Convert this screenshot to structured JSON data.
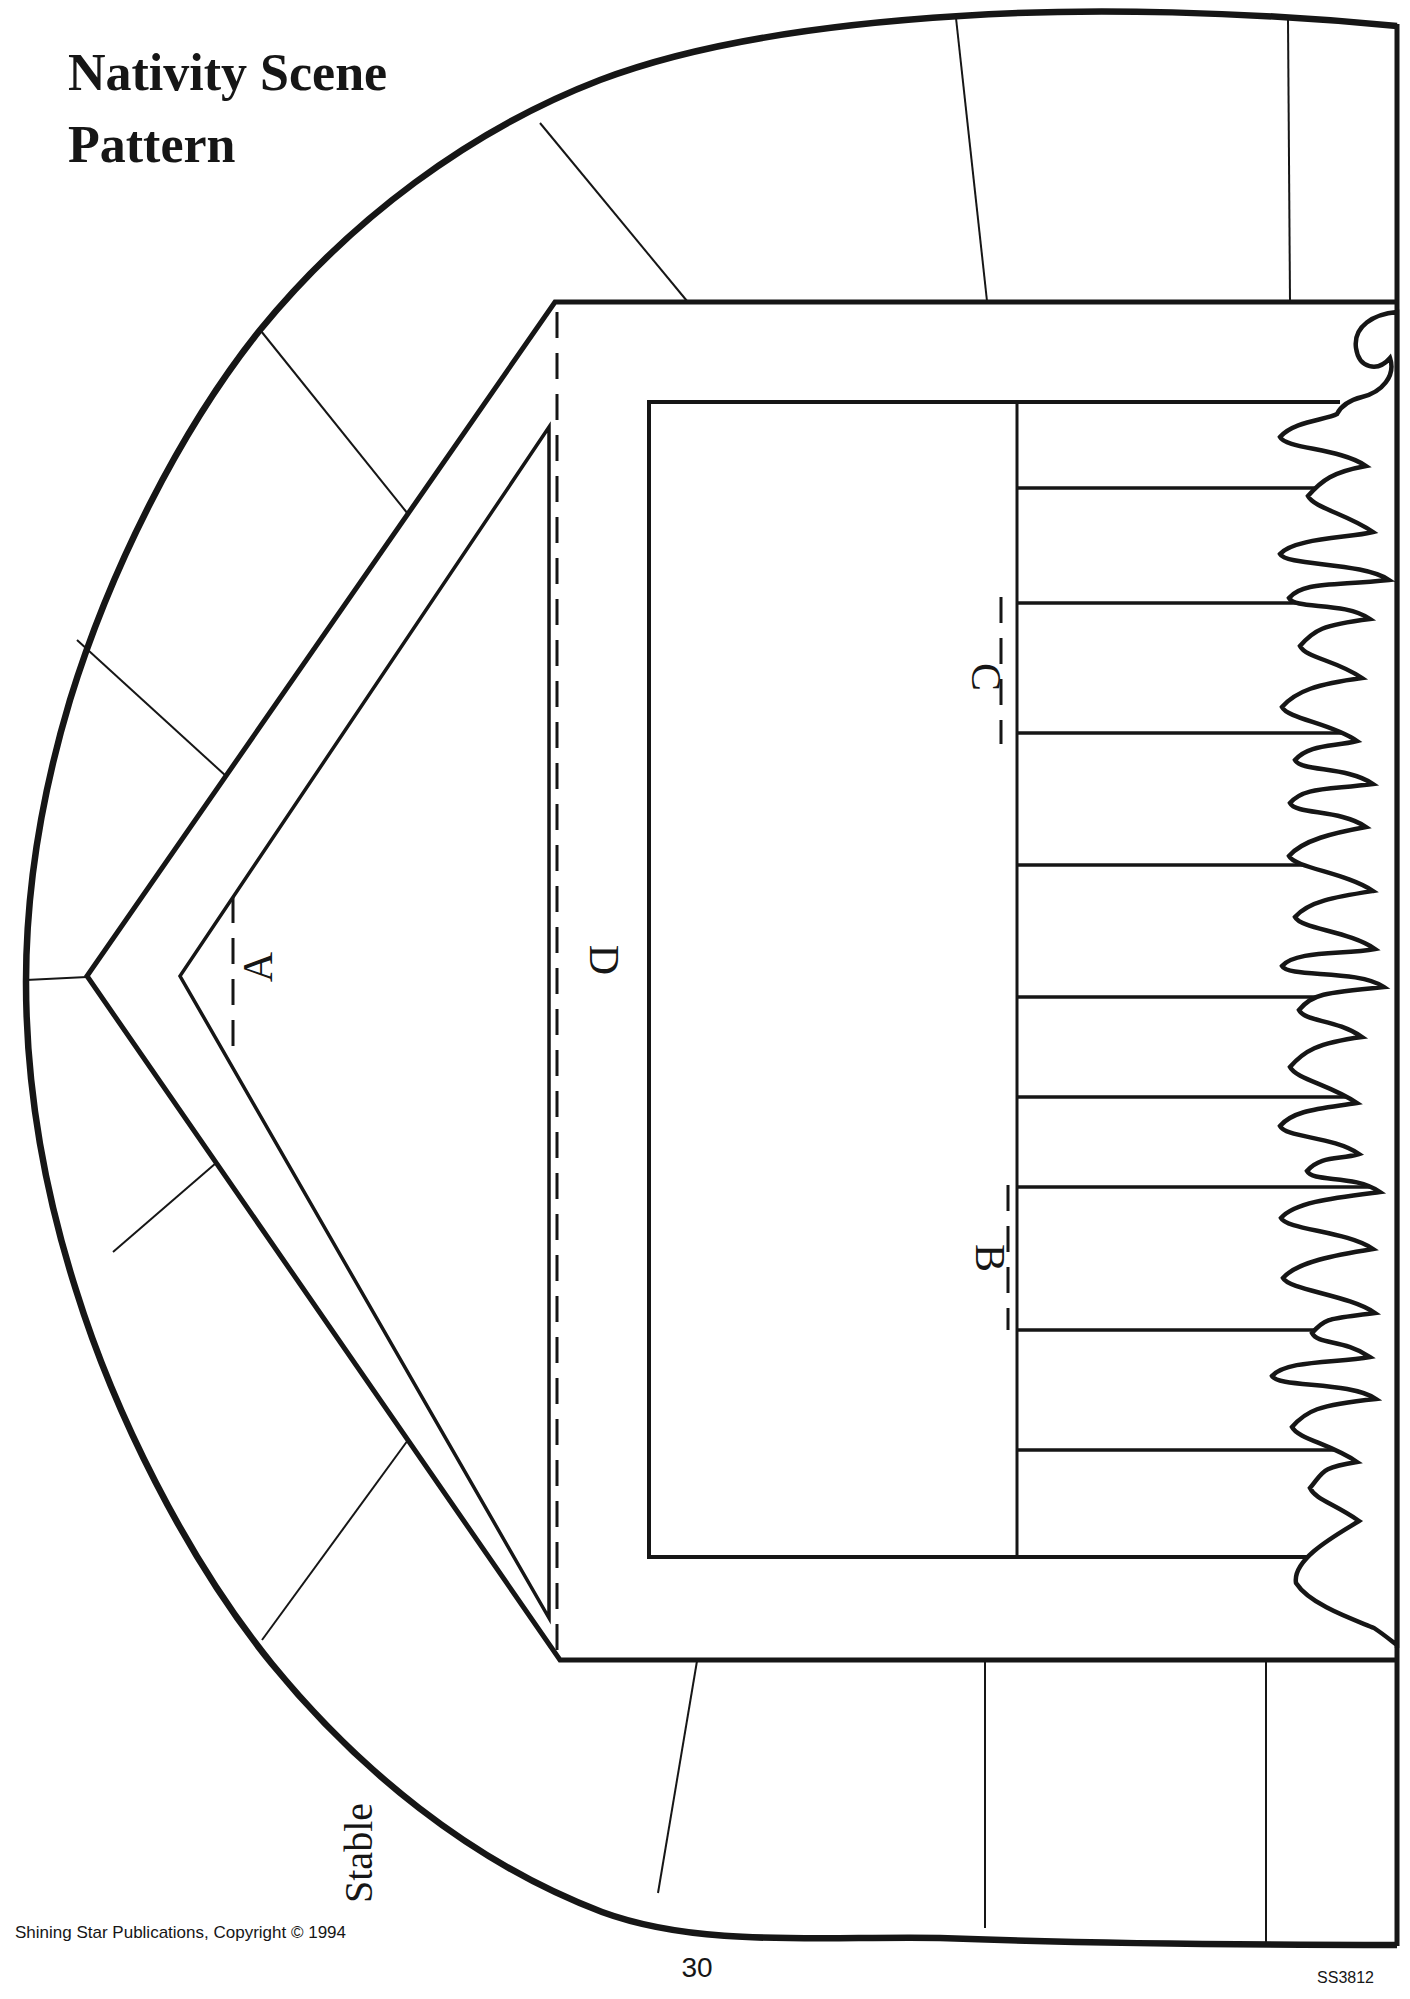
{
  "document": {
    "title_line1": "Nativity Scene",
    "title_line2": "Pattern",
    "piece_label": "Stable",
    "fold_labels": {
      "a": "A",
      "b": "B",
      "c": "C",
      "d": "D"
    },
    "footer": {
      "publisher": "Shining Star Publications, Copyright © 1994",
      "page_number": "30",
      "product_code": "SS3812"
    }
  },
  "colors": {
    "ink": "#161616",
    "paper": "#ffffff"
  }
}
